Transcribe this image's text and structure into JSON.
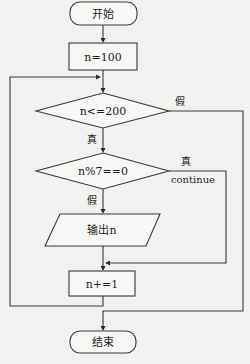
{
  "flowchart": {
    "nodes": {
      "start": {
        "label": "开始",
        "shape": "terminal"
      },
      "init": {
        "label": "n=100",
        "shape": "process"
      },
      "cond_range": {
        "label": "n<=200",
        "shape": "decision"
      },
      "cond_mod": {
        "label": "n%7==0",
        "shape": "decision"
      },
      "output": {
        "label": "输出n",
        "shape": "io"
      },
      "increment": {
        "label": "n+=1",
        "shape": "process"
      },
      "end": {
        "label": "结束",
        "shape": "terminal"
      }
    },
    "edges": {
      "range_false": {
        "label": "假",
        "from": "cond_range",
        "to": "end"
      },
      "range_true": {
        "label": "真",
        "from": "cond_range",
        "to": "cond_mod"
      },
      "mod_true": {
        "label": "真",
        "from": "cond_mod",
        "to": "increment"
      },
      "mod_true_note": {
        "label": "continue"
      },
      "mod_false": {
        "label": "假",
        "from": "cond_mod",
        "to": "output"
      },
      "loop_back": {
        "label": "",
        "from": "increment",
        "to": "cond_range"
      }
    }
  },
  "colors": {
    "background": "#f1f1ef",
    "stroke": "#3a3a3a",
    "fill": "#f7f7f5"
  }
}
